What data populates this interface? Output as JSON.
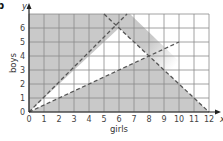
{
  "part_label": "b",
  "chart_data": {
    "type": "line",
    "title": "",
    "xlabel": "girls",
    "ylabel": "boys",
    "x_axis_symbol": "x",
    "y_axis_symbol": "y",
    "xlim": [
      0,
      12
    ],
    "ylim": [
      0,
      7
    ],
    "x_ticks": [
      0,
      1,
      2,
      3,
      4,
      5,
      6,
      7,
      8,
      9,
      10,
      11,
      12
    ],
    "y_ticks": [
      0,
      1,
      2,
      3,
      4,
      5,
      6
    ],
    "grid": true,
    "legend": null,
    "series": [
      {
        "name": "y = x",
        "style": "dashed",
        "x": [
          0,
          7
        ],
        "y": [
          0,
          7
        ]
      },
      {
        "name": "y = x/2",
        "style": "dashed",
        "x": [
          0,
          10
        ],
        "y": [
          0,
          5
        ]
      },
      {
        "name": "x + y = 12",
        "style": "dashed",
        "x": [
          5,
          12
        ],
        "y": [
          7,
          0
        ]
      }
    ],
    "unshaded_region": {
      "vertices": [
        [
          0,
          0
        ],
        [
          6,
          6
        ],
        [
          8,
          4
        ]
      ],
      "description": "feasible region left unshaded"
    },
    "intersections": [
      [
        6,
        6
      ],
      [
        8,
        4
      ]
    ],
    "colors": {
      "shade": "#c9c9c9",
      "grid": "#8a8a8a",
      "lines": "#555555"
    }
  }
}
